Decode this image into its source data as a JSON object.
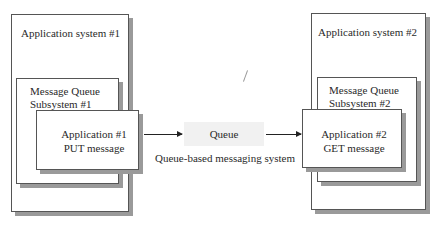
{
  "left_system": {
    "title": "Application system #1",
    "subsystem_line1": "Message Queue",
    "subsystem_line2": "Subsystem #1",
    "app_line1": "Application #1",
    "app_line2": "PUT message"
  },
  "right_system": {
    "title": "Application system #2",
    "subsystem_line1": "Message Queue",
    "subsystem_line2": "Subsystem #2",
    "app_line1": "Application #2",
    "app_line2": "GET message"
  },
  "queue": {
    "label": "Queue",
    "caption": "Queue-based messaging system"
  }
}
